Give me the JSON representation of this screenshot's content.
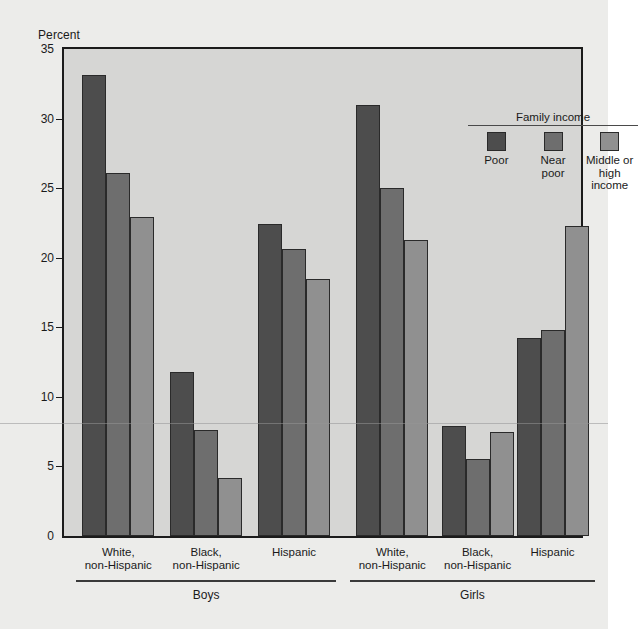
{
  "chart_data": {
    "type": "bar",
    "title": "",
    "xlabel": "",
    "ylabel": "Percent",
    "ylim": [
      0,
      35
    ],
    "yticks": [
      0,
      5,
      10,
      15,
      20,
      25,
      30,
      35
    ],
    "grid": false,
    "legend_title": "Family income",
    "legend_position": "top-right inside plot",
    "categories": [
      "White, non-Hispanic",
      "Black, non-Hispanic",
      "Hispanic",
      "White, non-Hispanic",
      "Black, non-Hispanic",
      "Hispanic"
    ],
    "group_labels": [
      "Boys",
      "Girls"
    ],
    "groups": [
      {
        "sex": "Boys",
        "categories": [
          "White, non-Hispanic",
          "Black, non-Hispanic",
          "Hispanic"
        ],
        "values": {
          "Poor": [
            33.1,
            11.8,
            22.4
          ],
          "Near poor": [
            26.1,
            7.6,
            20.6
          ],
          "Middle or high income": [
            22.9,
            4.2,
            18.5
          ]
        }
      },
      {
        "sex": "Girls",
        "categories": [
          "White, non-Hispanic",
          "Black, non-Hispanic",
          "Hispanic"
        ],
        "values": {
          "Poor": [
            31.0,
            7.9,
            14.2
          ],
          "Near poor": [
            25.0,
            5.5,
            14.8
          ],
          "Middle or high income": [
            21.3,
            7.5,
            22.3
          ]
        }
      }
    ],
    "series": [
      {
        "name": "Poor",
        "color": "#4d4d4d",
        "values": [
          33.1,
          11.8,
          22.4,
          31.0,
          7.9,
          14.2
        ]
      },
      {
        "name": "Near poor",
        "color": "#6e6e6e",
        "values": [
          26.1,
          7.6,
          20.6,
          25.0,
          5.5,
          14.8
        ]
      },
      {
        "name": "Middle or high income",
        "color": "#909090",
        "values": [
          22.9,
          4.2,
          18.5,
          21.3,
          7.5,
          22.3
        ]
      }
    ]
  },
  "axis": {
    "y_title": "Percent",
    "tick_labels": [
      "0",
      "5",
      "10",
      "15",
      "20",
      "25",
      "30",
      "35"
    ]
  },
  "legend": {
    "title": "Family income",
    "items": [
      {
        "label": "Poor",
        "color": "#4d4d4d"
      },
      {
        "label": "Near\npoor",
        "color": "#6e6e6e"
      },
      {
        "label": "Middle or\nhigh income",
        "color": "#909090"
      }
    ]
  },
  "categories": {
    "labels": [
      "White,\nnon-Hispanic",
      "Black,\nnon-Hispanic",
      "Hispanic",
      "White,\nnon-Hispanic",
      "Black,\nnon-Hispanic",
      "Hispanic"
    ],
    "sexes": [
      "Boys",
      "Girls"
    ]
  },
  "colors": {
    "page_background": "#ececea",
    "plot_background": "#d6d6d4",
    "axis_line": "#1b1b1b",
    "poor": "#4d4d4d",
    "near_poor": "#6e6e6e",
    "middle_high": "#909090"
  }
}
